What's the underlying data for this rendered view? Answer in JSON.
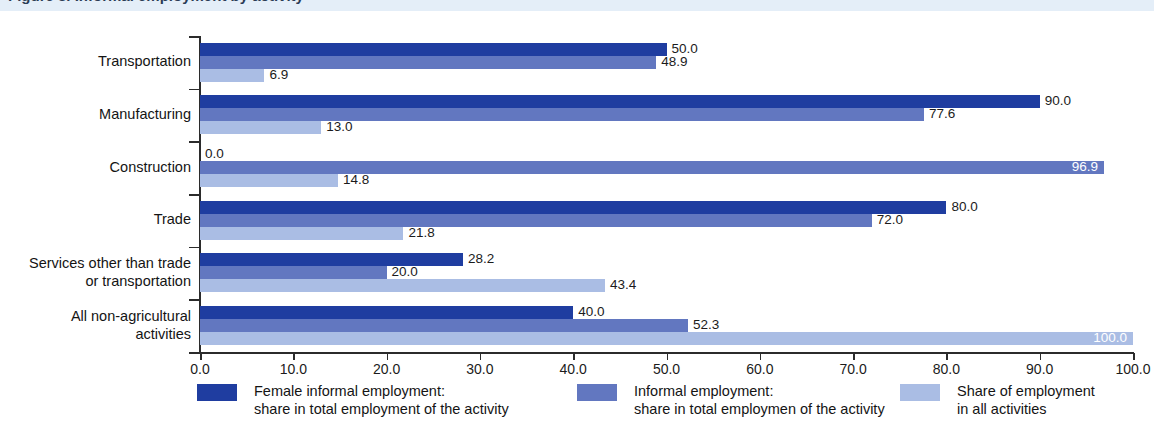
{
  "title": "Figure 3. Informal employment by activity",
  "colors": {
    "series0": "#1f3da0",
    "series1": "#6277c0",
    "series2": "#aabde4",
    "title_band": "#e4eef8",
    "axis": "#2b2b2b"
  },
  "legend": [
    {
      "swatch": "series0",
      "line1": "Female informal employment:",
      "line2": "share in total employment of the activity"
    },
    {
      "swatch": "series1",
      "line1": "Informal employment:",
      "line2": "share in total employmen of the activity"
    },
    {
      "swatch": "series2",
      "line1": "Share of employment",
      "line2": "in all activities"
    }
  ],
  "chart_data": {
    "type": "bar",
    "orientation": "horizontal",
    "title": "Informal employment by activity",
    "xlabel": "",
    "ylabel": "",
    "xlim": [
      0,
      100
    ],
    "xticks": [
      "0.0",
      "10.0",
      "20.0",
      "30.0",
      "40.0",
      "50.0",
      "60.0",
      "70.0",
      "80.0",
      "90.0",
      "100.0"
    ],
    "xtick_values": [
      0,
      10,
      20,
      30,
      40,
      50,
      60,
      70,
      80,
      90,
      100
    ],
    "grid": false,
    "legend_position": "bottom",
    "categories": [
      "Transportation",
      "Manufacturing",
      "Construction",
      "Trade",
      "Services other than trade or transportation",
      "All non-agricultural activities"
    ],
    "category_lines": [
      [
        "Transportation"
      ],
      [
        "Manufacturing"
      ],
      [
        "Construction"
      ],
      [
        "Trade"
      ],
      [
        "Services other than trade",
        "or transportation"
      ],
      [
        "All non-agricultural",
        "activities"
      ]
    ],
    "series": [
      {
        "name": "Female informal employment: share in total employment of the activity",
        "color": "#1f3da0",
        "values": [
          50.0,
          90.0,
          0.0,
          80.0,
          28.2,
          40.0
        ],
        "labels": [
          "50.0",
          "90.0",
          "0.0",
          "80.0",
          "28.2",
          "40.0"
        ],
        "label_placement": [
          "outside",
          "outside",
          "outside",
          "outside",
          "outside",
          "outside"
        ]
      },
      {
        "name": "Informal employment: share in total employmen of the activity",
        "color": "#6277c0",
        "values": [
          48.9,
          77.6,
          96.9,
          72.0,
          20.0,
          52.3
        ],
        "labels": [
          "48.9",
          "77.6",
          "96.9",
          "72.0",
          "20.0",
          "52.3"
        ],
        "label_placement": [
          "outside",
          "outside",
          "inside",
          "outside",
          "outside",
          "outside"
        ]
      },
      {
        "name": "Share of employment in all activities",
        "color": "#aabde4",
        "values": [
          6.9,
          13.0,
          14.8,
          21.8,
          43.4,
          100.0
        ],
        "labels": [
          "6.9",
          "13.0",
          "14.8",
          "21.8",
          "43.4",
          "100.0"
        ],
        "label_placement": [
          "outside",
          "outside",
          "outside",
          "outside",
          "outside",
          "inside"
        ]
      }
    ]
  }
}
